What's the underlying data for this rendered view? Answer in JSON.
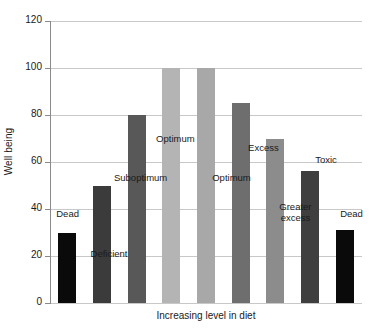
{
  "chart_data": {
    "type": "bar",
    "title": "",
    "xlabel": "Increasing level in diet",
    "ylabel": "Well being",
    "ylim": [
      0,
      120
    ],
    "ytick_labels": [
      "120",
      "100",
      "80",
      "60",
      "40",
      "20",
      "0"
    ],
    "ytick_values": [
      120,
      100,
      80,
      60,
      40,
      20,
      0
    ],
    "grid": true,
    "legend": "none",
    "categories": [
      "Dead",
      "Deficient",
      "Suboptimum",
      "Optimum",
      "Optimum",
      "Excess",
      "Greater excess",
      "Toxic",
      "Dead"
    ],
    "values": [
      30,
      50,
      80,
      100,
      100,
      85,
      70,
      56,
      31
    ],
    "bar_colors": [
      "#0a0a0a",
      "#3b3b3b",
      "#585858",
      "#b4b4b4",
      "#a8a8a8",
      "#6e6e6e",
      "#8c8c8c",
      "#3f3f3f",
      "#0a0a0a"
    ],
    "annotations": [
      {
        "text": "Dead",
        "x_pct": 2.0,
        "y_value": 38
      },
      {
        "text": "Deficient",
        "x_pct": 13.0,
        "y_value": 21
      },
      {
        "text": "Suboptimum",
        "x_pct": 20.5,
        "y_value": 53
      },
      {
        "text": "Optimum",
        "x_pct": 34.0,
        "y_value": 70
      },
      {
        "text": "Optimum",
        "x_pct": 52.0,
        "y_value": 53
      },
      {
        "text": "Excess",
        "x_pct": 63.5,
        "y_value": 66
      },
      {
        "text": "Greater\nexcess",
        "x_pct": 73.5,
        "y_value": 41
      },
      {
        "text": "Toxic",
        "x_pct": 85.0,
        "y_value": 61
      },
      {
        "text": "Dead",
        "x_pct": 93.0,
        "y_value": 38
      }
    ]
  },
  "axis": {
    "y_title": "Well being",
    "x_title": "Increasing level in diet"
  }
}
